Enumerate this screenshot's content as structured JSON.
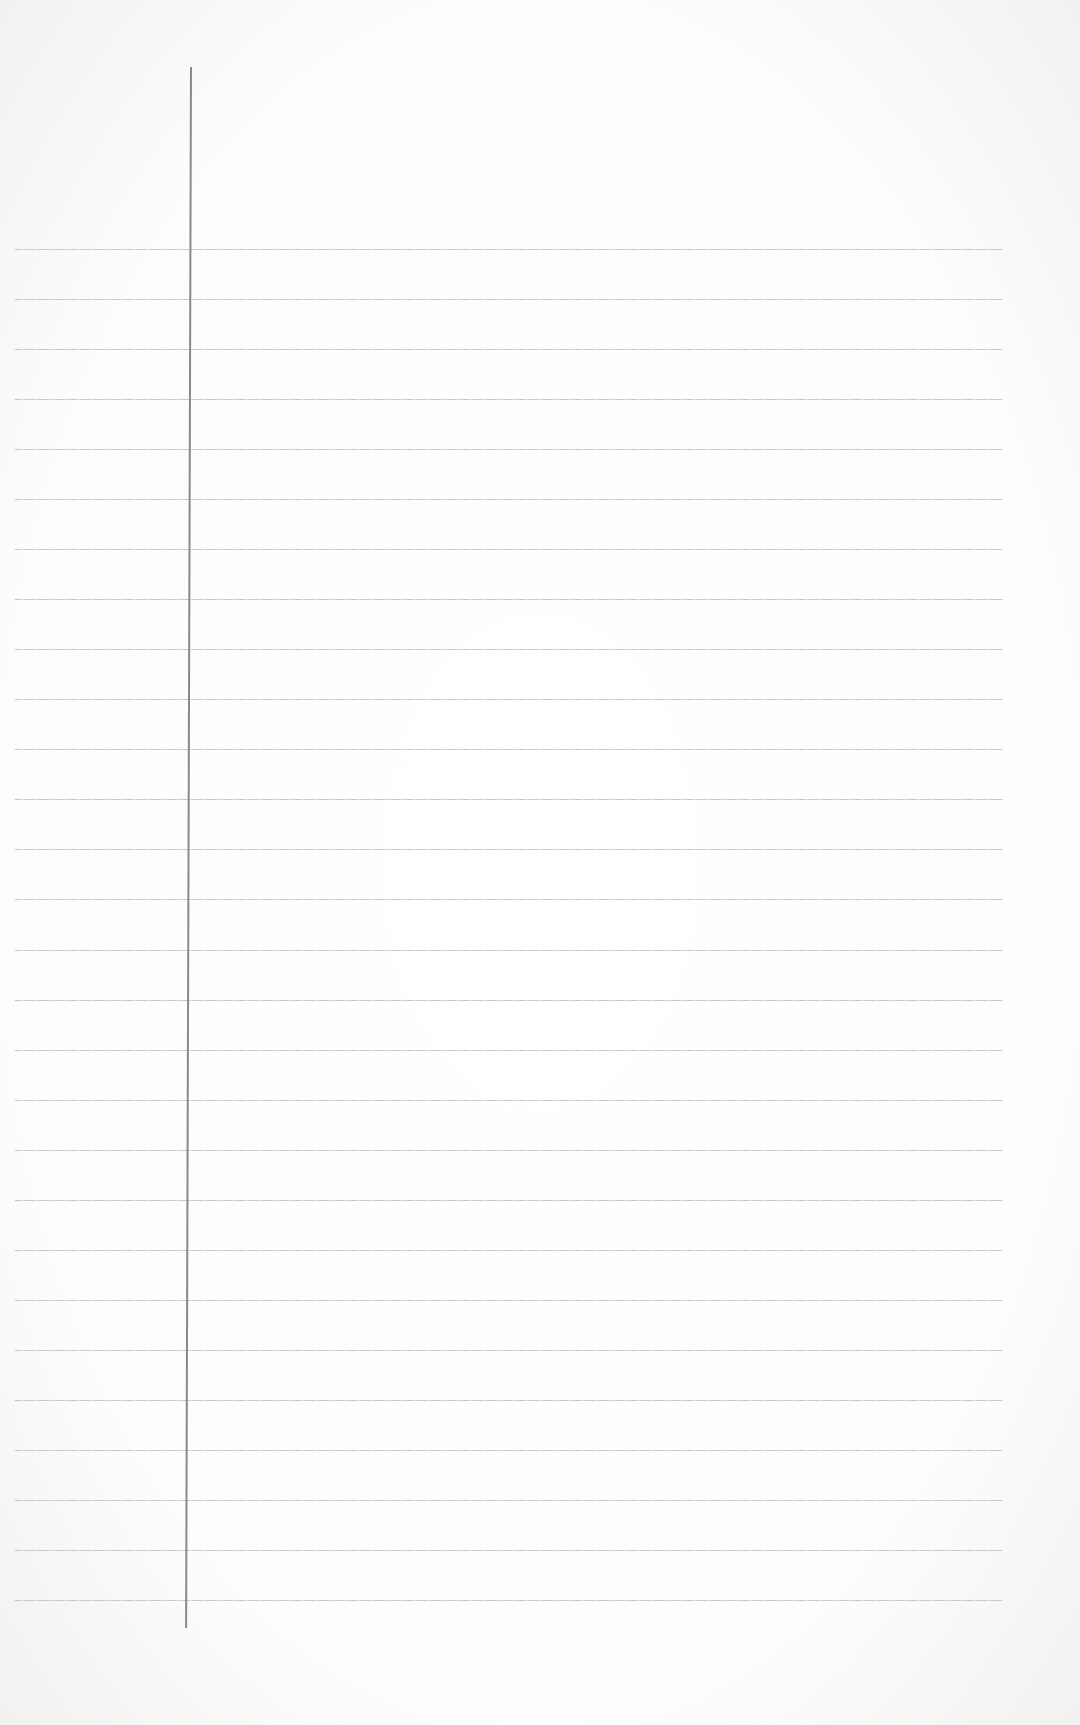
{
  "page": {
    "type": "lined-notebook-page",
    "background_color": "#fdfdfd",
    "rule_color": "#c4c4c4",
    "margin_color": "#8a8a8a",
    "ruled_line_count": 28,
    "content": ""
  }
}
